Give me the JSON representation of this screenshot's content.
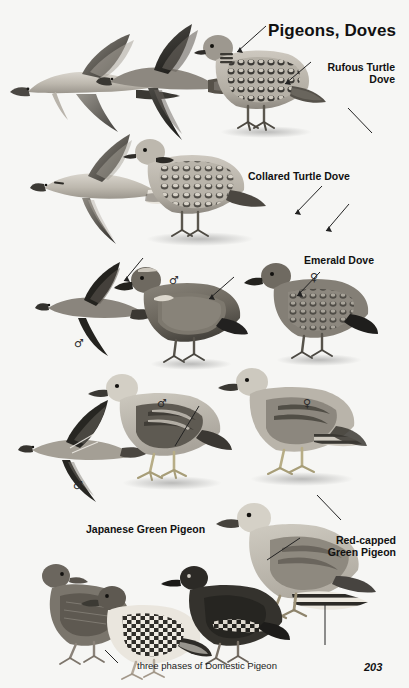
{
  "page": {
    "plate_title": "Pigeons, Doves",
    "page_number": "203",
    "background_color": "#f6f6f4",
    "ink_color": "#111111"
  },
  "species_labels": [
    {
      "id": "rufous-turtle-dove",
      "text": "Rufous Turtle\nDove",
      "align": "right"
    },
    {
      "id": "collared-turtle-dove",
      "text": "Collared Turtle Dove",
      "align": "left"
    },
    {
      "id": "emerald-dove",
      "text": "Emerald Dove",
      "align": "left"
    },
    {
      "id": "japanese-green-pigeon",
      "text": "Japanese Green Pigeon",
      "align": "left"
    },
    {
      "id": "red-capped-green-pigeon",
      "text": "Red-capped\nGreen Pigeon",
      "align": "right"
    }
  ],
  "caption": "three phases of Domestic Pigeon",
  "sex_symbols": [
    {
      "id": "emerald-dove-flight-male",
      "glyph": "♂"
    },
    {
      "id": "emerald-dove-male",
      "glyph": "♂"
    },
    {
      "id": "emerald-dove-female",
      "glyph": "♀"
    },
    {
      "id": "green-pigeon-flight-male",
      "glyph": "♂"
    },
    {
      "id": "japanese-green-pigeon-male",
      "glyph": "♂"
    },
    {
      "id": "japanese-green-pigeon-female",
      "glyph": "♀"
    }
  ],
  "figures": [
    {
      "id": "rufous-turtle-dove-flight-upper",
      "kind": "flying-dove"
    },
    {
      "id": "rufous-turtle-dove-flight-dark",
      "kind": "flying-dove"
    },
    {
      "id": "rufous-turtle-dove-perched",
      "kind": "perched-dove"
    },
    {
      "id": "collared-turtle-dove-flight",
      "kind": "flying-dove"
    },
    {
      "id": "collared-turtle-dove-perched",
      "kind": "perched-dove"
    },
    {
      "id": "emerald-dove-flight",
      "kind": "flying-dove"
    },
    {
      "id": "emerald-dove-male-perched",
      "kind": "perched-dove"
    },
    {
      "id": "emerald-dove-female-perched",
      "kind": "perched-dove"
    },
    {
      "id": "green-pigeon-flight",
      "kind": "flying-pigeon"
    },
    {
      "id": "japanese-green-pigeon-male-perched",
      "kind": "perched-pigeon"
    },
    {
      "id": "japanese-green-pigeon-female-perched",
      "kind": "perched-pigeon"
    },
    {
      "id": "red-capped-green-pigeon-perched",
      "kind": "perched-pigeon"
    },
    {
      "id": "domestic-pigeon-phase-1",
      "kind": "perched-pigeon"
    },
    {
      "id": "domestic-pigeon-phase-2",
      "kind": "perched-pigeon"
    },
    {
      "id": "domestic-pigeon-phase-3",
      "kind": "perched-pigeon"
    }
  ]
}
